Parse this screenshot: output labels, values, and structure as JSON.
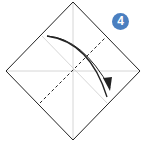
{
  "diagram": {
    "step_number": "4",
    "badge_color": "#4a7fc0",
    "instruction": "Valley fold along the dashed line in the direction of the arrow"
  }
}
